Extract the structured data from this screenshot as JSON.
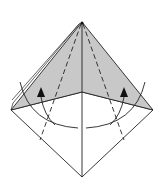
{
  "diagram": {
    "type": "origami-fold-step",
    "colors": {
      "paper_colored": "#c8c8c8",
      "paper_white": "#ffffff",
      "line": "#222222"
    },
    "annotations": {
      "valley_folds": 2,
      "fold_arrows": 2
    }
  }
}
